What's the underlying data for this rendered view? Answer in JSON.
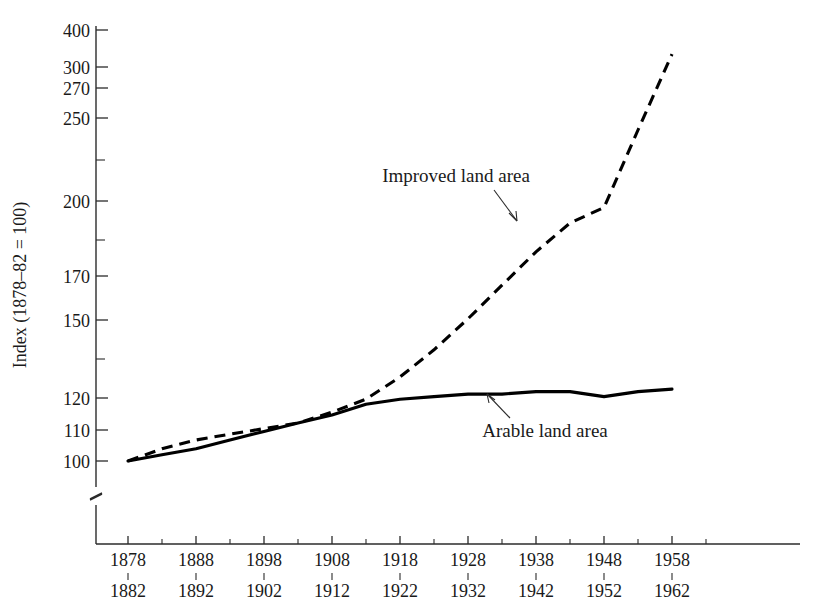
{
  "chart_data": {
    "type": "line",
    "title": "",
    "xlabel": "",
    "ylabel": "Index (1878–82 = 100)",
    "yscale": "log",
    "ylim": [
      96,
      420
    ],
    "grid": false,
    "legend": "inline-annotations",
    "axis_break": true,
    "y_ticks_labeled": [
      100,
      110,
      120,
      150,
      170,
      200,
      250,
      270,
      300,
      400
    ],
    "y_ticks_unlabeled": [
      135,
      185,
      225,
      350
    ],
    "x_categories": [
      "1878\n1882",
      "1888\n1892",
      "1898\n1902",
      "1908\n1912",
      "1918\n1922",
      "1928\n1932",
      "1938\n1942",
      "1948\n1952",
      "1958\n1962"
    ],
    "x_tick_top": [
      "1878",
      "1888",
      "1898",
      "1908",
      "1918",
      "1928",
      "1938",
      "1948",
      "1958"
    ],
    "x_tick_bottom": [
      "1882",
      "1892",
      "1902",
      "1912",
      "1922",
      "1932",
      "1942",
      "1952",
      "1962"
    ],
    "series": [
      {
        "name": "Arable land area",
        "style": "solid",
        "x": [
          1880,
          1885,
          1890,
          1895,
          1900,
          1905,
          1910,
          1915,
          1920,
          1925,
          1930,
          1935,
          1940,
          1945,
          1950,
          1955,
          1960
        ],
        "values": [
          100,
          102,
          104,
          107,
          110,
          113,
          116,
          120,
          122,
          123,
          124,
          124,
          125,
          125,
          123,
          125,
          126
        ]
      },
      {
        "name": "Improved land area",
        "style": "dashed",
        "x": [
          1880,
          1885,
          1890,
          1895,
          1900,
          1905,
          1910,
          1915,
          1920,
          1925,
          1930,
          1935,
          1940,
          1945,
          1950,
          1955,
          1960
        ],
        "values": [
          100,
          104,
          107,
          109,
          111,
          113,
          117,
          122,
          131,
          143,
          158,
          176,
          196,
          215,
          226,
          290,
          370
        ]
      }
    ],
    "annotations": [
      {
        "text": "Improved land area",
        "x_px": 456,
        "y_px": 182,
        "leader_to_x": 511,
        "leader_to_y": 218
      },
      {
        "text": "Arable land area",
        "x_px": 488,
        "y_px": 430,
        "leader_to_x": 460,
        "leader_to_y": 399
      }
    ]
  },
  "axis_titles": {
    "y": "Index (1878–82 = 100)"
  }
}
